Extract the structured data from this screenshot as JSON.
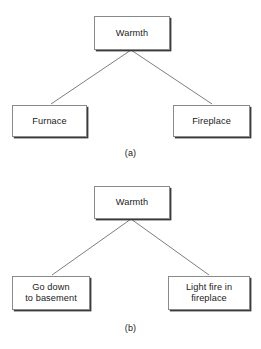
{
  "figure": {
    "background_color": "#ffffff",
    "box_border_color": "#8a8a8a",
    "box_shadow_color": "#3a3a3a",
    "edge_color": "#6e6e6e",
    "text_color": "#1a1a1a"
  },
  "diagram_a": {
    "caption": "(a)",
    "root": {
      "label": "Warmth"
    },
    "children": [
      {
        "label": "Furnace"
      },
      {
        "label": "Fireplace"
      }
    ],
    "edges": [
      {
        "from": "Warmth",
        "to": "Furnace"
      },
      {
        "from": "Warmth",
        "to": "Fireplace"
      }
    ]
  },
  "diagram_b": {
    "caption": "(b)",
    "root": {
      "label": "Warmth"
    },
    "children": [
      {
        "label": "Go down\nto basement"
      },
      {
        "label": "Light fire in\nfireplace"
      }
    ],
    "edges": [
      {
        "from": "Warmth",
        "to": "Go down to basement"
      },
      {
        "from": "Warmth",
        "to": "Light fire in fireplace"
      }
    ]
  }
}
